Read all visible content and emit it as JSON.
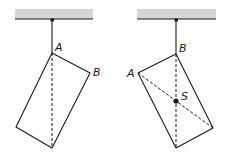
{
  "figures": [
    {
      "id": "left",
      "description": "Rectangle suspended from point A; dashed vertical line through A",
      "labels": {
        "top_vertex": "A",
        "right_vertex": "B"
      }
    },
    {
      "id": "right",
      "description": "Rectangle suspended from point B; dashed vertical through B and dashed diagonal from A intersect at centre of mass S",
      "labels": {
        "top_vertex": "B",
        "left_vertex": "A",
        "centre": "S"
      }
    }
  ],
  "colors": {
    "line": "#1a1a1a",
    "ceiling_fill": "#d6d6d6"
  }
}
